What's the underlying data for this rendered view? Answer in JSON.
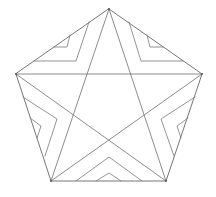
{
  "diagram": {
    "title": "",
    "stroke_color": "#777777",
    "background": "#ffffff",
    "pentagon_vertices": [
      [
        109,
        9
      ],
      [
        202,
        74
      ],
      [
        166,
        181
      ],
      [
        51,
        181
      ],
      [
        16,
        74
      ]
    ],
    "pentagram_edges": [
      [
        [
          109,
          9
        ],
        [
          166,
          181
        ]
      ],
      [
        [
          166,
          181
        ],
        [
          16,
          74
        ]
      ],
      [
        [
          16,
          74
        ],
        [
          202,
          74
        ]
      ],
      [
        [
          202,
          74
        ],
        [
          51,
          181
        ]
      ],
      [
        [
          51,
          181
        ],
        [
          109,
          9
        ]
      ]
    ],
    "chevrons": [
      {
        "region": "top-left",
        "outer": [
          [
            89,
            22
          ],
          [
            76,
            61
          ],
          [
            34,
            61
          ]
        ],
        "inner": [
          [
            70,
            35
          ],
          [
            67,
            47
          ],
          [
            54,
            47
          ]
        ]
      },
      {
        "region": "top-right",
        "outer": [
          [
            129,
            22
          ],
          [
            141,
            61
          ],
          [
            183,
            61
          ]
        ],
        "inner": [
          [
            147,
            35
          ],
          [
            150,
            47
          ],
          [
            163,
            47
          ]
        ]
      },
      {
        "region": "left",
        "outer": [
          [
            23,
            97
          ],
          [
            57,
            119
          ],
          [
            45,
            156
          ]
        ],
        "inner": [
          [
            30,
            118
          ],
          [
            41,
            126
          ],
          [
            37,
            138
          ]
        ]
      },
      {
        "region": "right",
        "outer": [
          [
            195,
            97
          ],
          [
            161,
            119
          ],
          [
            174,
            156
          ]
        ],
        "inner": [
          [
            188,
            118
          ],
          [
            177,
            126
          ],
          [
            181,
            138
          ]
        ]
      },
      {
        "region": "bottom",
        "outer": [
          [
            76,
            181
          ],
          [
            109,
            157
          ],
          [
            142,
            181
          ]
        ],
        "inner": [
          [
            96,
            181
          ],
          [
            109,
            173
          ],
          [
            121,
            181
          ]
        ]
      }
    ]
  }
}
